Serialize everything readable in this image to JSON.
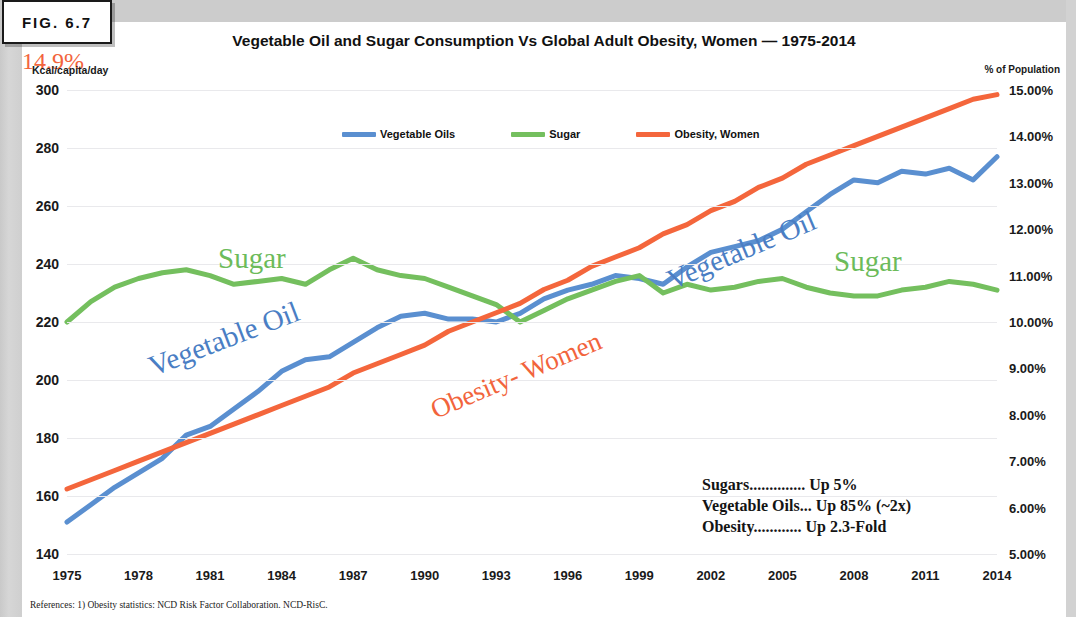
{
  "figure": {
    "label": "FIG. 6.7"
  },
  "chart_data": {
    "type": "line",
    "title": "Vegetable Oil and Sugar Consumption Vs Global Adult Obesity, Women — 1975-2014",
    "xlabel": "",
    "ylabel": "Kcal/capita/day",
    "ylabel_right": "% of Population",
    "grid": true,
    "legend_position": "top-center",
    "ylim": [
      140,
      300
    ],
    "ylim_right": [
      5,
      15
    ],
    "yticks_left": [
      "300",
      "280",
      "260",
      "240",
      "220",
      "200",
      "180",
      "160",
      "140"
    ],
    "yticks_right": [
      "15.00%",
      "14.00%",
      "13.00%",
      "12.00%",
      "11.00%",
      "10.00%",
      "9.00%",
      "8.00%",
      "7.00%",
      "6.00%",
      "5.00%"
    ],
    "xticks": [
      "1975",
      "1978",
      "1981",
      "1984",
      "1987",
      "1990",
      "1993",
      "1996",
      "1999",
      "2002",
      "2005",
      "2008",
      "2011",
      "2014"
    ],
    "x": [
      1975,
      1976,
      1977,
      1978,
      1979,
      1980,
      1981,
      1982,
      1983,
      1984,
      1985,
      1986,
      1987,
      1988,
      1989,
      1990,
      1991,
      1992,
      1993,
      1994,
      1995,
      1996,
      1997,
      1998,
      1999,
      2000,
      2001,
      2002,
      2003,
      2004,
      2005,
      2006,
      2007,
      2008,
      2009,
      2010,
      2011,
      2012,
      2013,
      2014
    ],
    "series": [
      {
        "name": "Vegetable Oils",
        "color": "#5a8fd0",
        "axis": "left",
        "unit": "Kcal/capita/day",
        "values": [
          151,
          157,
          163,
          168,
          173,
          181,
          184,
          190,
          196,
          203,
          207,
          208,
          213,
          218,
          222,
          223,
          221,
          221,
          220,
          223,
          228,
          231,
          233,
          236,
          235,
          233,
          239,
          244,
          246,
          248,
          252,
          258,
          264,
          269,
          268,
          272,
          271,
          273,
          269,
          277
        ]
      },
      {
        "name": "Sugar",
        "color": "#74bf5e",
        "axis": "left",
        "unit": "Kcal/capita/day",
        "values": [
          220,
          227,
          232,
          235,
          237,
          238,
          236,
          233,
          234,
          235,
          233,
          238,
          242,
          238,
          236,
          235,
          232,
          229,
          226,
          220,
          224,
          228,
          231,
          234,
          236,
          230,
          233,
          231,
          232,
          234,
          235,
          232,
          230,
          229,
          229,
          231,
          232,
          234,
          233,
          231
        ]
      },
      {
        "name": "Obesity, Women",
        "color": "#f4663c",
        "axis": "right",
        "unit": "% of Population",
        "values": [
          6.4,
          6.6,
          6.8,
          7.0,
          7.2,
          7.4,
          7.6,
          7.8,
          8.0,
          8.2,
          8.4,
          8.6,
          8.9,
          9.1,
          9.3,
          9.5,
          9.8,
          10.0,
          10.2,
          10.4,
          10.7,
          10.9,
          11.2,
          11.4,
          11.6,
          11.9,
          12.1,
          12.4,
          12.6,
          12.9,
          13.1,
          13.4,
          13.6,
          13.8,
          14.0,
          14.2,
          14.4,
          14.6,
          14.8,
          14.9
        ]
      }
    ],
    "annotations": [
      {
        "name": "sugar-left",
        "text": "Sugar",
        "color": "#6cbb5a"
      },
      {
        "name": "sugar-right",
        "text": "Sugar",
        "color": "#6cbb5a"
      },
      {
        "name": "vegetable-oil-left",
        "text": "Vegetable Oil",
        "color": "#4a7ec4"
      },
      {
        "name": "vegetable-oil-right",
        "text": "Vegetable Oil",
        "color": "#4a7ec4"
      },
      {
        "name": "obesity-women",
        "text": "Obesity- Women",
        "color": "#f2643c"
      },
      {
        "name": "start-value",
        "text": "6.4%",
        "color": "#f2643c"
      },
      {
        "name": "end-value",
        "text": "14.9%",
        "color": "#f2643c"
      }
    ]
  },
  "legend": [
    {
      "label": "Vegetable Oils",
      "color": "#5a8fd0"
    },
    {
      "label": "Sugar",
      "color": "#74bf5e"
    },
    {
      "label": "Obesity, Women",
      "color": "#f4663c"
    }
  ],
  "summary": {
    "rows": [
      "Sugars.............. Up 5%",
      "Vegetable Oils... Up 85% (~2x)",
      "Obesity............ Up 2.3-Fold"
    ]
  },
  "references": {
    "text": "References: 1) Obesity statistics: NCD Risk Factor Collaboration. NCD-RisC."
  }
}
